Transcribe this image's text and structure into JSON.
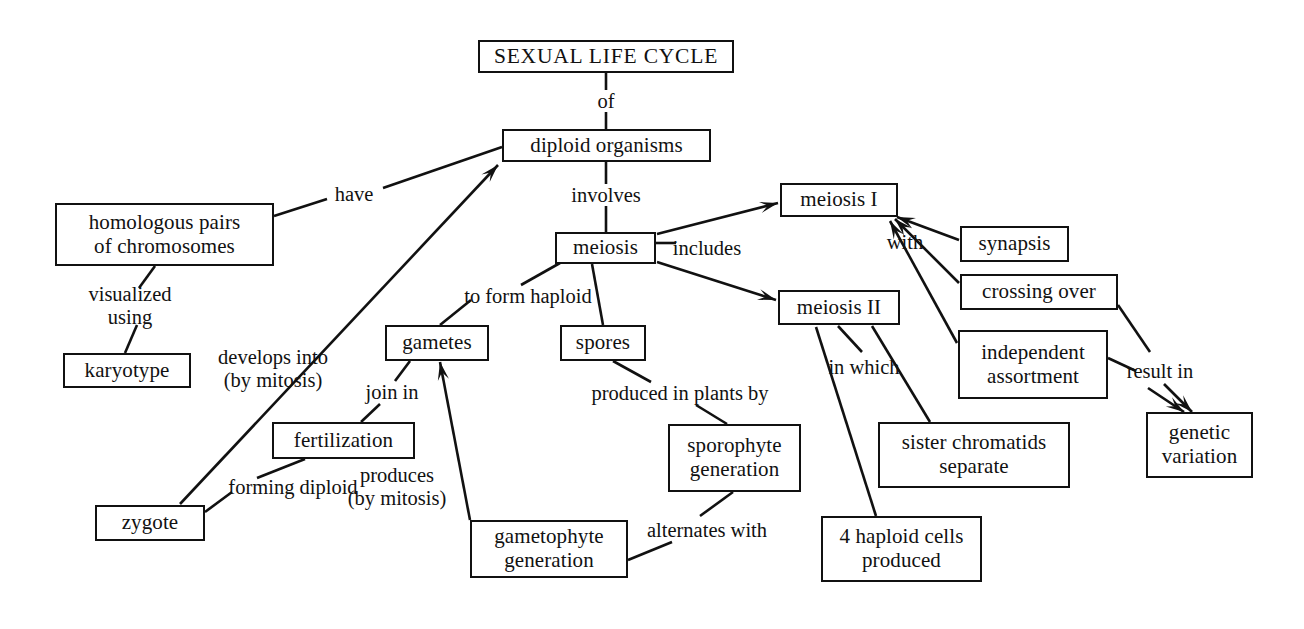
{
  "diagram": {
    "title": "SEXUAL LIFE CYCLE",
    "background_color": "#ffffff",
    "line_color": "#111111",
    "text_color": "#111111",
    "width": 1304,
    "height": 629
  },
  "nodes": [
    {
      "id": "sexual-life-cycle",
      "text": "SEXUAL LIFE CYCLE",
      "x": 478,
      "y": 40,
      "w": 256,
      "h": 33
    },
    {
      "id": "diploid-organisms",
      "text": "diploid organisms",
      "x": 502,
      "y": 129,
      "w": 209,
      "h": 33
    },
    {
      "id": "homologous-pairs",
      "text": "homologous pairs\nof chromosomes",
      "x": 55,
      "y": 203,
      "w": 219,
      "h": 63
    },
    {
      "id": "karyotype",
      "text": "karyotype",
      "x": 63,
      "y": 353,
      "w": 128,
      "h": 35
    },
    {
      "id": "meiosis",
      "text": "meiosis",
      "x": 555,
      "y": 232,
      "w": 101,
      "h": 32
    },
    {
      "id": "meiosis-i",
      "text": "meiosis I",
      "x": 780,
      "y": 183,
      "w": 118,
      "h": 34
    },
    {
      "id": "meiosis-ii",
      "text": "meiosis II",
      "x": 778,
      "y": 290,
      "w": 122,
      "h": 35
    },
    {
      "id": "synapsis",
      "text": "synapsis",
      "x": 960,
      "y": 226,
      "w": 109,
      "h": 36
    },
    {
      "id": "crossing-over",
      "text": "crossing over",
      "x": 960,
      "y": 274,
      "w": 158,
      "h": 36
    },
    {
      "id": "independent-assortment",
      "text": "independent\nassortment",
      "x": 958,
      "y": 330,
      "w": 150,
      "h": 69
    },
    {
      "id": "genetic-variation",
      "text": "genetic\nvariation",
      "x": 1146,
      "y": 412,
      "w": 107,
      "h": 66
    },
    {
      "id": "gametes",
      "text": "gametes",
      "x": 385,
      "y": 325,
      "w": 104,
      "h": 36
    },
    {
      "id": "spores",
      "text": "spores",
      "x": 560,
      "y": 325,
      "w": 86,
      "h": 36
    },
    {
      "id": "fertilization",
      "text": "fertilization",
      "x": 272,
      "y": 422,
      "w": 143,
      "h": 37
    },
    {
      "id": "zygote",
      "text": "zygote",
      "x": 95,
      "y": 505,
      "w": 110,
      "h": 36
    },
    {
      "id": "sporophyte-generation",
      "text": "sporophyte\ngeneration",
      "x": 668,
      "y": 424,
      "w": 133,
      "h": 68
    },
    {
      "id": "gametophyte-generation",
      "text": "gametophyte\ngeneration",
      "x": 470,
      "y": 520,
      "w": 158,
      "h": 58
    },
    {
      "id": "sister-chromatids-separate",
      "text": "sister chromatids\nseparate",
      "x": 878,
      "y": 422,
      "w": 192,
      "h": 66
    },
    {
      "id": "4-haploid-cells",
      "text": "4 haploid cells\nproduced",
      "x": 821,
      "y": 516,
      "w": 161,
      "h": 66
    }
  ],
  "link_labels": [
    {
      "id": "of",
      "text": "of",
      "x": 606,
      "y": 101
    },
    {
      "id": "involves",
      "text": "involves",
      "x": 606,
      "y": 195
    },
    {
      "id": "have",
      "text": "have",
      "x": 354,
      "y": 194
    },
    {
      "id": "visualized-using",
      "text": "visualized\nusing",
      "x": 130,
      "y": 306
    },
    {
      "id": "includes",
      "text": "includes",
      "x": 707,
      "y": 248
    },
    {
      "id": "with",
      "text": "with",
      "x": 905,
      "y": 242
    },
    {
      "id": "result-in",
      "text": "result in",
      "x": 1160,
      "y": 371
    },
    {
      "id": "to-form-haploid",
      "text": "to form haploid",
      "x": 528,
      "y": 296
    },
    {
      "id": "in-which",
      "text": "in which",
      "x": 864,
      "y": 367
    },
    {
      "id": "develops-into",
      "text": "develops into\n(by mitosis)",
      "x": 273,
      "y": 369
    },
    {
      "id": "join-in",
      "text": "join in",
      "x": 392,
      "y": 392
    },
    {
      "id": "produces-by-mitosis",
      "text": "produces\n(by mitosis)",
      "x": 397,
      "y": 487
    },
    {
      "id": "produced-in-plants-by",
      "text": "produced in plants by",
      "x": 680,
      "y": 393
    },
    {
      "id": "forming-diploid",
      "text": "forming diploid",
      "x": 293,
      "y": 487
    },
    {
      "id": "alternates-with",
      "text": "alternates with",
      "x": 707,
      "y": 530
    }
  ],
  "links": [
    {
      "id": "cycle-to-diploid-upper",
      "from": "sexual-life-cycle",
      "to": "of-label",
      "points": "606,73 606,90",
      "arrow": false
    },
    {
      "id": "cycle-to-diploid-lower",
      "from": "of-label",
      "to": "diploid-organisms",
      "points": "606,112 606,129",
      "arrow": false
    },
    {
      "id": "diploid-to-meiosis-upper",
      "from": "diploid-organisms",
      "to": "involves-label",
      "points": "606,162 606,184",
      "arrow": false
    },
    {
      "id": "diploid-to-meiosis-lower",
      "from": "involves-label",
      "to": "meiosis",
      "points": "606,206 606,232",
      "arrow": false
    },
    {
      "id": "homologous-to-have",
      "from": "homologous-pairs",
      "to": "have-label",
      "points": "274,216 327,199",
      "arrow": false
    },
    {
      "id": "have-to-diploid",
      "from": "have-label",
      "to": "diploid-organisms",
      "points": "383,188 502,147",
      "arrow": false
    },
    {
      "id": "homologous-to-visualized",
      "from": "homologous-pairs",
      "to": "visualized-using-label",
      "points": "155,266 139,288",
      "arrow": false
    },
    {
      "id": "visualized-to-karyotype",
      "from": "visualized-using-label",
      "to": "karyotype",
      "points": "137,325 125,353",
      "arrow": false
    },
    {
      "id": "zygote-to-diploid",
      "from": "zygote",
      "to": "diploid-organisms",
      "points": "180,504 498,165",
      "arrow": true
    },
    {
      "id": "meiosis-to-includes",
      "from": "meiosis",
      "to": "includes-label",
      "points": "656,243 676,243",
      "arrow": false
    },
    {
      "id": "meiosis-to-meiosis-i",
      "from": "meiosis",
      "to": "meiosis-i",
      "points": "657,234 778,203",
      "arrow": true
    },
    {
      "id": "meiosis-to-meiosis-ii",
      "from": "meiosis",
      "to": "meiosis-ii",
      "points": "657,262 776,300",
      "arrow": true
    },
    {
      "id": "synapsis-to-with",
      "from": "synapsis",
      "to": "meiosis-i",
      "points": "959,240 897,217",
      "arrow": true
    },
    {
      "id": "crossing-over-to-meiosis-i",
      "from": "crossing-over",
      "to": "meiosis-i",
      "points": "959,283 895,219",
      "arrow": true
    },
    {
      "id": "independent-to-meiosis-i",
      "from": "independent-assortment",
      "to": "meiosis-i",
      "points": "957,343 890,221",
      "arrow": true
    },
    {
      "id": "crossing-over-to-result",
      "from": "crossing-over",
      "to": "result-in-label",
      "points": "1118,305 1150,352",
      "arrow": false
    },
    {
      "id": "independent-to-result",
      "from": "independent-assortment",
      "to": "result-in-label",
      "points": "1108,358 1136,371",
      "arrow": false
    },
    {
      "id": "result-to-genetic-variation-a",
      "from": "result-in-label",
      "to": "genetic-variation",
      "points": "1148,388 1184,412",
      "arrow": true
    },
    {
      "id": "result-to-genetic-variation-b",
      "from": "result-in-label",
      "to": "genetic-variation",
      "points": "1164,384 1192,412",
      "arrow": true
    },
    {
      "id": "meiosis-to-haploid-label",
      "from": "meiosis",
      "to": "to-form-haploid-label",
      "points": "560,263 521,285",
      "arrow": false
    },
    {
      "id": "haploid-label-to-gametes",
      "from": "to-form-haploid-label",
      "to": "gametes",
      "points": "471,300 440,325",
      "arrow": false
    },
    {
      "id": "meiosis-to-spores",
      "from": "meiosis",
      "to": "spores",
      "points": "592,264 603,325",
      "arrow": false
    },
    {
      "id": "gametes-to-join-in",
      "from": "gametes",
      "to": "join-in-label",
      "points": "410,361 395,381",
      "arrow": false
    },
    {
      "id": "join-in-to-fertilization",
      "from": "join-in-label",
      "to": "fertilization",
      "points": "380,404 361,422",
      "arrow": false
    },
    {
      "id": "fertilization-to-forming",
      "from": "fertilization",
      "to": "forming-diploid-label",
      "points": "305,459 257,478",
      "arrow": false
    },
    {
      "id": "forming-to-zygote",
      "from": "forming-diploid-label",
      "to": "zygote",
      "points": "232,492 205,512",
      "arrow": false
    },
    {
      "id": "gametophyte-to-gametes",
      "from": "gametophyte-generation",
      "to": "gametes",
      "points": "470,520 440,362",
      "arrow": true
    },
    {
      "id": "spores-to-produced",
      "from": "spores",
      "to": "produced-in-plants-by-label",
      "points": "613,361 651,382",
      "arrow": false
    },
    {
      "id": "produced-to-sporophyte",
      "from": "produced-in-plants-by-label",
      "to": "sporophyte-generation",
      "points": "696,405 727,424",
      "arrow": false
    },
    {
      "id": "sporophyte-to-alternates",
      "from": "sporophyte-generation",
      "to": "alternates-with-label",
      "points": "733,492 700,516",
      "arrow": false
    },
    {
      "id": "alternates-to-gametophyte",
      "from": "alternates-with-label",
      "to": "gametophyte-generation",
      "points": "672,542 628,560",
      "arrow": false
    },
    {
      "id": "meiosis-ii-to-in-which",
      "from": "meiosis-ii",
      "to": "in-which-label",
      "points": "838,326 862,352",
      "arrow": false
    },
    {
      "id": "meiosis-ii-to-sister",
      "from": "meiosis-ii",
      "to": "sister-chromatids-separate",
      "points": "872,326 930,422",
      "arrow": false
    },
    {
      "id": "meiosis-ii-to-haploid-cells",
      "from": "meiosis-ii",
      "to": "4-haploid-cells",
      "points": "816,327 876,516",
      "arrow": false
    }
  ]
}
